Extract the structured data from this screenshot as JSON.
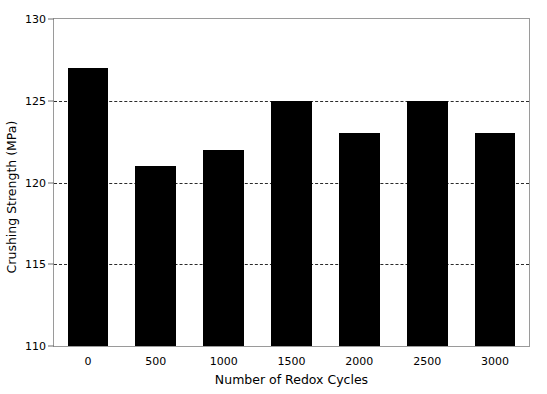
{
  "chart_data": {
    "type": "bar",
    "title": "",
    "xlabel": "Number of Redox Cycles",
    "ylabel": "Crushing Strength (MPa)",
    "categories": [
      "0",
      "500",
      "1000",
      "1500",
      "2000",
      "2500",
      "3000"
    ],
    "values": [
      127,
      121,
      122,
      125,
      123,
      125,
      123
    ],
    "ylim": [
      110,
      130
    ],
    "yticks": [
      "110",
      "115",
      "120",
      "125",
      "130"
    ],
    "ytick_values": [
      110,
      115,
      120,
      125,
      130
    ],
    "gridlines_at": [
      115,
      120,
      125
    ],
    "grid": true,
    "legend": null,
    "bar_color": "#000000",
    "frame_color": "#9a9a9a",
    "grid_color": "#2b2b2b",
    "background": "#ffffff"
  }
}
